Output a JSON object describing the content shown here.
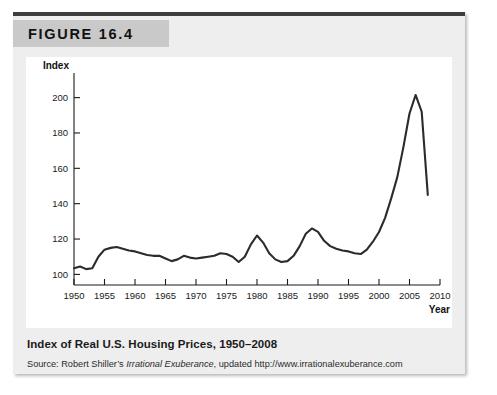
{
  "figure": {
    "label": "FIGURE 16.4",
    "caption": "Index of Real U.S. Housing Prices, 1950–2008",
    "source_prefix": "Source: Robert Shiller’s ",
    "source_italic": "Irrational Exuberance",
    "source_suffix": ", updated http://www.irrationalexuberance.com"
  },
  "colors": {
    "card_background": "#eeeeee",
    "header_band": "#c9c9c9",
    "top_rule": "#3d3d3d",
    "plot_background": "#ffffff",
    "line": "#2b2b2b",
    "axis": "#1a1a1a"
  },
  "chart_data": {
    "type": "line",
    "title": "Index of Real U.S. Housing Prices, 1950–2008",
    "xlabel": "Year",
    "ylabel": "Index",
    "xlim": [
      1950,
      2010
    ],
    "ylim": [
      94,
      206
    ],
    "grid": false,
    "legend": "none",
    "xticks": [
      1950,
      1955,
      1960,
      1965,
      1970,
      1975,
      1980,
      1985,
      1990,
      1995,
      2000,
      2005,
      2010
    ],
    "yticks": [
      100,
      120,
      140,
      160,
      180,
      200
    ],
    "series": [
      {
        "name": "Real U.S. Housing Price Index",
        "x": [
          1950,
          1951,
          1952,
          1953,
          1954,
          1955,
          1956,
          1957,
          1958,
          1959,
          1960,
          1961,
          1962,
          1963,
          1964,
          1965,
          1966,
          1967,
          1968,
          1969,
          1970,
          1971,
          1972,
          1973,
          1974,
          1975,
          1976,
          1977,
          1978,
          1979,
          1980,
          1981,
          1982,
          1983,
          1984,
          1985,
          1986,
          1987,
          1988,
          1989,
          1990,
          1991,
          1992,
          1993,
          1994,
          1995,
          1996,
          1997,
          1998,
          1999,
          2000,
          2001,
          2002,
          2003,
          2004,
          2005,
          2006,
          2007,
          2008
        ],
        "y": [
          103.5,
          104.5,
          103.0,
          103.5,
          110.0,
          114.0,
          115.0,
          115.5,
          114.5,
          113.5,
          113.0,
          112.0,
          111.0,
          110.5,
          110.5,
          109.0,
          107.5,
          108.5,
          110.5,
          109.5,
          109.0,
          109.5,
          110.0,
          110.5,
          112.0,
          111.5,
          110.0,
          107.0,
          110.0,
          117.0,
          122.0,
          118.0,
          112.0,
          108.5,
          107.0,
          107.5,
          110.5,
          116.0,
          123.0,
          126.0,
          124.0,
          119.0,
          116.0,
          114.5,
          113.5,
          113.0,
          112.0,
          111.5,
          114.0,
          118.5,
          124.0,
          132.0,
          143.0,
          155.0,
          172.0,
          191.0,
          201.5,
          192.0,
          145.0
        ]
      }
    ]
  }
}
